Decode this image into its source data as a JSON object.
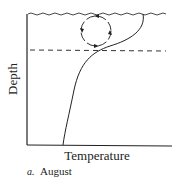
{
  "diagram": {
    "y_axis_label": "Depth",
    "x_axis_label": "Temperature",
    "caption_letter": "a.",
    "caption_text": "August",
    "elements": {
      "surface": "wavy water surface line",
      "thermocline": "dashed horizontal line",
      "mixing_cell": "clockwise circulation circle with arrows",
      "profile": "temperature-depth curve"
    },
    "colors": {
      "ink": "#222222",
      "background": "#ffffff"
    }
  }
}
